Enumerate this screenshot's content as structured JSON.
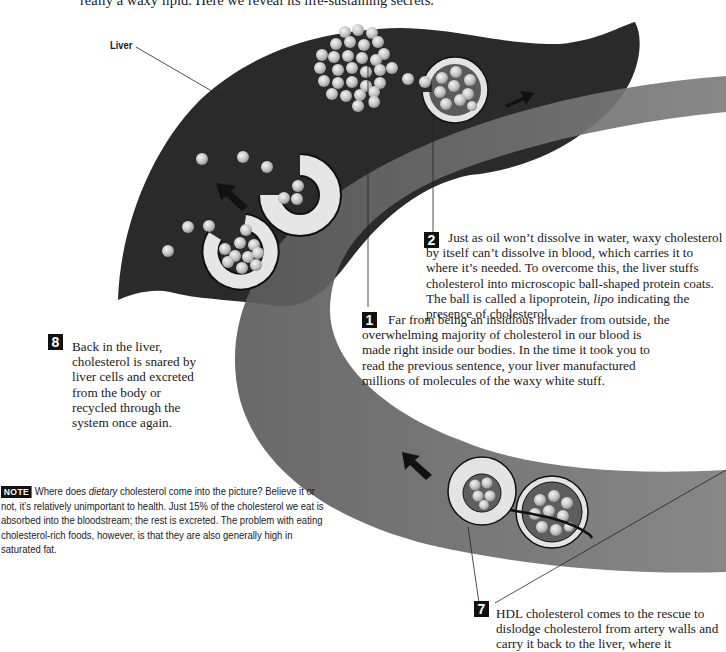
{
  "intro": {
    "text": "really a waxy lipid. Here we reveal its life-sustaining secrets."
  },
  "labels": {
    "liver": "Liver"
  },
  "steps": [
    {
      "number": "1",
      "text": "Far from being an insidious invader from outside, the overwhelming majority of cholesterol in our blood is made right inside our bodies. In the time it took you to read the previous sentence, your liver manufactured millions of molecules of the waxy white stuff."
    },
    {
      "number": "2",
      "text_before": "Just as oil won’t dissolve in water, waxy cholesterol by itself can’t dissolve in blood, which carries it to where it’s needed. To overcome this, the liver stuffs cholesterol into microscopic ball-shaped protein coats. The ball is called a lipoprotein, ",
      "italic": "lipo",
      "text_after": " indicating the presence of cholesterol."
    },
    {
      "number": "7",
      "text": "HDL cholesterol comes to the rescue to dislodge cholesterol from artery walls and carry it back to the liver, where it"
    },
    {
      "number": "8",
      "text": "Back in the liver, cholesterol is snared by liver cells and excreted from the body or recycled through the system once again."
    }
  ],
  "note": {
    "badge": "NOTE",
    "text_before": "Where does ",
    "italic": "dietary",
    "text_after": " cholesterol come into the picture? Believe it or not, it’s relatively unimportant to health. Just 15% of the cholesterol we eat is absorbed into the bloodstream; the rest is excreted. The problem with eating cholesterol-rich foods, however, is that they are also generally high in saturated fat."
  },
  "colors": {
    "liver": "#2b2b2b",
    "vessel": "#6e6e6e",
    "particle": "#c8c8c8",
    "coat": "#e6e6e6",
    "badge": "#111111"
  }
}
